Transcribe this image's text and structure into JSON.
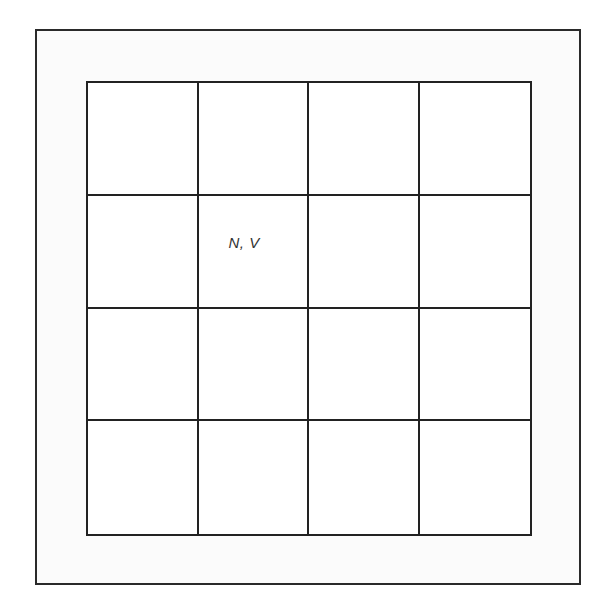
{
  "diagram": {
    "type": "grid",
    "rows": 4,
    "columns": 4,
    "cells": [
      [
        "",
        "",
        "",
        ""
      ],
      [
        "",
        "N, V",
        "",
        ""
      ],
      [
        "",
        "",
        "",
        ""
      ],
      [
        "",
        "",
        "",
        ""
      ]
    ],
    "colors": {
      "line": "#222222",
      "frame": "#2a2a2a",
      "background": "#ffffff"
    }
  }
}
